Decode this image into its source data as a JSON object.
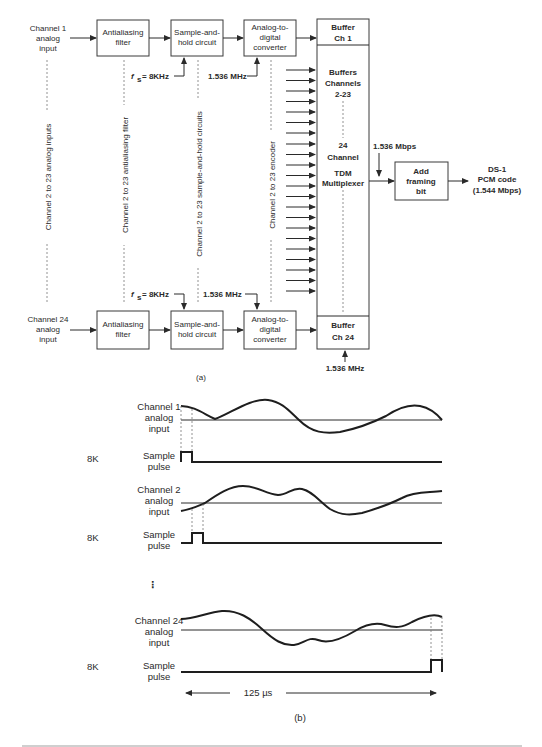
{
  "figure_a": {
    "label": "(a)",
    "channel1": {
      "input": [
        "Channel 1",
        "analog",
        "input"
      ],
      "filter": [
        "Antialiasing",
        "filter"
      ],
      "sample_hold": [
        "Sample-and-",
        "hold circuit"
      ],
      "adc": [
        "Analog-to-",
        "digital",
        "converter"
      ],
      "buffer": [
        "Buffer",
        "Ch 1"
      ],
      "fs": "= 8KHz",
      "adc_clock": "1.536 MHz"
    },
    "channel24": {
      "input": [
        "Channel 24",
        "analog",
        "input"
      ],
      "filter": [
        "Antialiasing",
        "filter"
      ],
      "sample_hold": [
        "Sample-and-",
        "hold circuit"
      ],
      "adc": [
        "Analog-to-",
        "digital",
        "converter"
      ],
      "buffer": [
        "Buffer",
        "Ch 24"
      ],
      "fs": "= 8KHz",
      "adc_clock": "1.536 MHz",
      "buffer_clock": "1.536 MHz"
    },
    "fs_symbol": "f",
    "fs_subscript": "s",
    "vertical_labels": {
      "inputs": "Channel 2 to 23 analog inputs",
      "filters": "Channel 2 to 23 antialiasing filter",
      "sample_hold": "Channel 2 to 23 sample-and-hold circuits",
      "encoder": "Channel 2 to 23 encoder"
    },
    "multiplexer": {
      "buffers_label": [
        "Buffers",
        "Channels",
        "2-23"
      ],
      "channel_label": [
        "24",
        "Channel"
      ],
      "tdm_label": [
        "TDM",
        "Multiplexer"
      ],
      "output_rate": "1.536 Mbps"
    },
    "framing": {
      "label": [
        "Add",
        "framing",
        "bit"
      ],
      "output": [
        "DS-1",
        "PCM code",
        "(1.544 Mbps)"
      ]
    }
  },
  "figure_b": {
    "label": "(b)",
    "rows": [
      {
        "signal_label": [
          "Channel 1",
          "analog",
          "input"
        ],
        "rate": "8K",
        "pulse_label": [
          "Sample",
          "pulse"
        ]
      },
      {
        "signal_label": [
          "Channel 2",
          "analog",
          "input"
        ],
        "rate": "8K",
        "pulse_label": [
          "Sample",
          "pulse"
        ]
      },
      {
        "signal_label": [
          "Channel 24",
          "analog",
          "input"
        ],
        "rate": "8K",
        "pulse_label": [
          "Sample",
          "pulse"
        ]
      }
    ],
    "ellipsis": "⋮",
    "frame_duration": "125 µs"
  }
}
